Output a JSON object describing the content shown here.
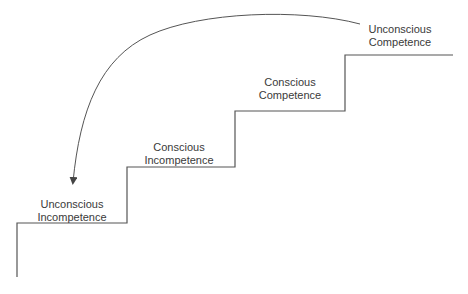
{
  "diagram": {
    "type": "staircase",
    "stages": [
      {
        "line1": "Unconscious",
        "line2": "Incompetence"
      },
      {
        "line1": "Conscious",
        "line2": "Incompetence"
      },
      {
        "line1": "Conscious",
        "line2": "Competence"
      },
      {
        "line1": "Unconscious",
        "line2": "Competence"
      }
    ],
    "arrow": {
      "from": "Unconscious Competence",
      "to": "Unconscious Incompetence",
      "shape": "curved"
    },
    "colors": {
      "line": "#555555",
      "text": "#3a3a3a",
      "background": "#ffffff"
    }
  }
}
